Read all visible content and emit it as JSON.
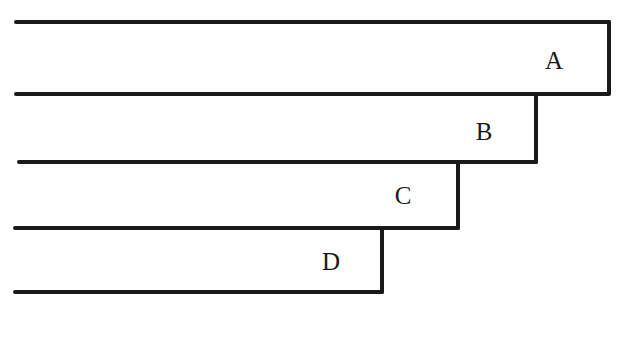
{
  "diagram": {
    "type": "stepped-bars",
    "stroke_color": "#1a1a1a",
    "bars": [
      {
        "label": "A",
        "top": 22,
        "bottom": 93,
        "left": 16,
        "right": 609,
        "label_x": 554,
        "label_y": 60
      },
      {
        "label": "B",
        "top": 93,
        "bottom": 162,
        "left": 18,
        "right": 536,
        "label_x": 484,
        "label_y": 131
      },
      {
        "label": "C",
        "top": 162,
        "bottom": 228,
        "left": 15,
        "right": 458,
        "label_x": 403,
        "label_y": 195
      },
      {
        "label": "D",
        "top": 228,
        "bottom": 292,
        "left": 15,
        "right": 382,
        "label_x": 331,
        "label_y": 261
      }
    ]
  }
}
